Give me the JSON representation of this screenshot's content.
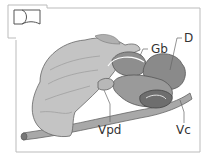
{
  "figure": {
    "type": "anatomical-diagram",
    "orientation_icon": "body-section-icon",
    "labels": {
      "gb": "Gb",
      "d": "D",
      "vpd": "Vpd",
      "vc": "Vc"
    }
  },
  "colors": {
    "frame": "#bbbbbb",
    "liver": "#c8c8c8",
    "liver_dark": "#9a9a9a",
    "organ_dark": "#8a8a8a",
    "vessel": "#9e9e9e",
    "outline": "#555555"
  }
}
